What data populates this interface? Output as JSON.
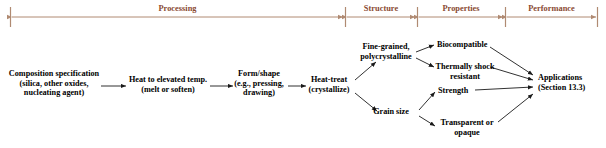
{
  "figure": {
    "type": "process-flow-diagram",
    "accent_color": "#8a4a32",
    "text_color": "#000000",
    "background": "#ffffff"
  },
  "header": {
    "spans": [
      {
        "label": "Processing",
        "start_x": 10,
        "end_x": 345
      },
      {
        "label": "Structure",
        "start_x": 345,
        "end_x": 417
      },
      {
        "label": "Properties",
        "start_x": 417,
        "end_x": 505
      },
      {
        "label": "Performance",
        "start_x": 505,
        "end_x": 598
      }
    ]
  },
  "nodes": [
    {
      "id": "composition",
      "label": "Composition specification\n(silica, other oxides,\nnucleating agent)",
      "stage": "Processing"
    },
    {
      "id": "heat-elevated",
      "label": "Heat to elevated temp.\n(melt or soften)",
      "stage": "Processing"
    },
    {
      "id": "form-shape",
      "label": "Form/shape\n(e.g., pressing,\ndrawing)",
      "stage": "Processing"
    },
    {
      "id": "heat-treat",
      "label": "Heat-treat\n(crystallize)",
      "stage": "Processing"
    },
    {
      "id": "fine-grained",
      "label": "Fine-grained,\npolycrystalline",
      "stage": "Structure"
    },
    {
      "id": "grain-size",
      "label": "Grain size",
      "stage": "Structure"
    },
    {
      "id": "biocompatible",
      "label": "Biocompatible",
      "stage": "Properties"
    },
    {
      "id": "thermal-shock",
      "label": "Thermally shock\nresistant",
      "stage": "Properties"
    },
    {
      "id": "strength",
      "label": "Strength",
      "stage": "Properties"
    },
    {
      "id": "transparent",
      "label": "Transparent or\nopaque",
      "stage": "Properties"
    },
    {
      "id": "applications",
      "label": "Applications\n(Section 13.3)",
      "stage": "Performance"
    }
  ],
  "edges": [
    {
      "from": "composition",
      "to": "heat-elevated"
    },
    {
      "from": "heat-elevated",
      "to": "form-shape"
    },
    {
      "from": "form-shape",
      "to": "heat-treat"
    },
    {
      "from": "heat-treat",
      "to": "fine-grained"
    },
    {
      "from": "heat-treat",
      "to": "grain-size"
    },
    {
      "from": "fine-grained",
      "to": "biocompatible"
    },
    {
      "from": "fine-grained",
      "to": "thermal-shock"
    },
    {
      "from": "grain-size",
      "to": "strength"
    },
    {
      "from": "grain-size",
      "to": "transparent"
    },
    {
      "from": "biocompatible",
      "to": "applications"
    },
    {
      "from": "thermal-shock",
      "to": "applications"
    },
    {
      "from": "strength",
      "to": "applications"
    },
    {
      "from": "transparent",
      "to": "applications"
    }
  ]
}
